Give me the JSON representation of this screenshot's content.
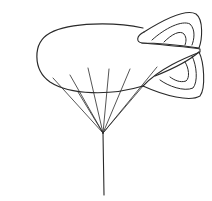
{
  "drawing": {
    "subject": "blimp with tethered strings",
    "background": "#ffffff",
    "stroke_color": "#2a2a2a",
    "string_count": 8
  }
}
